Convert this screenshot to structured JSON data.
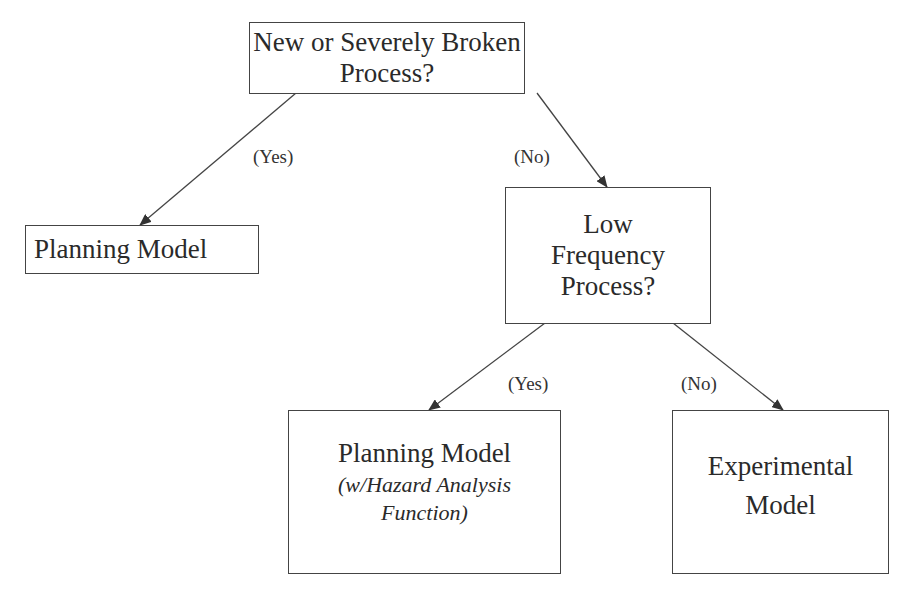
{
  "nodes": {
    "root": {
      "lines": [
        "New or Severely Broken",
        "Process?"
      ]
    },
    "planning_simple": {
      "lines": [
        "Planning Model"
      ]
    },
    "low_frequency": {
      "lines": [
        "Low",
        "Frequency",
        "Process?"
      ]
    },
    "planning_hazard": {
      "title": "Planning Model",
      "subtitle_lines": [
        "(w/Hazard Analysis",
        "Function)"
      ]
    },
    "experimental": {
      "lines": [
        "Experimental",
        "Model"
      ]
    }
  },
  "edges": {
    "root_yes": "(Yes)",
    "root_no": "(No)",
    "lowfreq_yes": "(Yes)",
    "lowfreq_no": "(No)"
  },
  "colors": {
    "line": "#444444",
    "text": "#2a2a2a"
  }
}
